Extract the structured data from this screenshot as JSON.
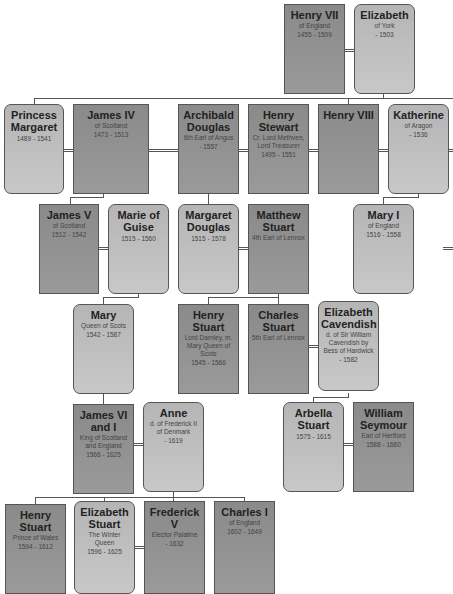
{
  "colors": {
    "male_box": "#8f8f8f",
    "female_box": "#bdbdbd",
    "connector": "#555555",
    "text": "#222222"
  },
  "people": [
    {
      "id": "henry7",
      "name": "Henry VII",
      "detail": "of England",
      "years": "1455 - 1509",
      "sex": "m"
    },
    {
      "id": "elizabeth_york",
      "name": "Elizabeth",
      "detail": "of York",
      "years": "- 1503",
      "sex": "f"
    },
    {
      "id": "margaret_tudor",
      "name": "Princess Margaret",
      "detail": "",
      "years": "1489 - 1541",
      "sex": "f"
    },
    {
      "id": "james4",
      "name": "James IV",
      "detail": "of Scotland",
      "years": "1473 - 1513",
      "sex": "m"
    },
    {
      "id": "archibald",
      "name": "Archibald Douglas",
      "detail": "6th Earl of Angus",
      "years": "- 1557",
      "sex": "m"
    },
    {
      "id": "henry_stewart",
      "name": "Henry Stewart",
      "detail": "Cr. Lord Methven, Lord Treasurer",
      "years": "1495 - 1551",
      "sex": "m"
    },
    {
      "id": "henry8",
      "name": "Henry VIII",
      "detail": "",
      "years": "",
      "sex": "m"
    },
    {
      "id": "katherine",
      "name": "Katherine",
      "detail": "of Aragon",
      "years": "- 1536",
      "sex": "f"
    },
    {
      "id": "james5",
      "name": "James V",
      "detail": "of Scotland",
      "years": "1512 - 1542",
      "sex": "m"
    },
    {
      "id": "marie_guise",
      "name": "Marie of Guise",
      "detail": "",
      "years": "1515 - 1560",
      "sex": "f"
    },
    {
      "id": "margaret_douglas",
      "name": "Margaret Douglas",
      "detail": "",
      "years": "1515 - 1578",
      "sex": "f"
    },
    {
      "id": "matthew_stuart",
      "name": "Matthew Stuart",
      "detail": "4th Earl of Lennox",
      "years": "",
      "sex": "m"
    },
    {
      "id": "mary1",
      "name": "Mary I",
      "detail": "of England",
      "years": "1516 - 1558",
      "sex": "f"
    },
    {
      "id": "mary_scots",
      "name": "Mary",
      "detail": "Queen of Scots",
      "years": "1542 - 1587",
      "sex": "f"
    },
    {
      "id": "darnley",
      "name": "Henry Stuart",
      "detail": "Lord Darnley, m. Mary Queen of Scots",
      "years": "1545 - 1566",
      "sex": "m"
    },
    {
      "id": "charles_stuart",
      "name": "Charles Stuart",
      "detail": "5th Earl of Lennox",
      "years": "",
      "sex": "m"
    },
    {
      "id": "eliz_cavendish",
      "name": "Elizabeth Cavendish",
      "detail": "d. of Sir William Cavendish by Bess of Hardwick",
      "years": "- 1582",
      "sex": "f"
    },
    {
      "id": "james6",
      "name": "James VI and I",
      "detail": "King of Scotland and England",
      "years": "1566 - 1625",
      "sex": "m"
    },
    {
      "id": "anne",
      "name": "Anne",
      "detail": "d. of Frederick II of Denmark",
      "years": "- 1619",
      "sex": "f"
    },
    {
      "id": "arbella",
      "name": "Arbella Stuart",
      "detail": "",
      "years": "1575 - 1615",
      "sex": "f"
    },
    {
      "id": "seymour",
      "name": "William Seymour",
      "detail": "Earl of Hertford",
      "years": "1588 - 1660",
      "sex": "m"
    },
    {
      "id": "henry_wales",
      "name": "Henry Stuart",
      "detail": "Prince of Wales",
      "years": "1594 - 1612",
      "sex": "m"
    },
    {
      "id": "eliz_stuart",
      "name": "Elizabeth Stuart",
      "detail": "The Winter Queen",
      "years": "1596 - 1625",
      "sex": "f"
    },
    {
      "id": "frederick5",
      "name": "Frederick V",
      "detail": "Elector Palatine",
      "years": "- 1632",
      "sex": "m"
    },
    {
      "id": "charles1",
      "name": "Charles I",
      "detail": "of England",
      "years": "1602 - 1649",
      "sex": "m"
    }
  ]
}
